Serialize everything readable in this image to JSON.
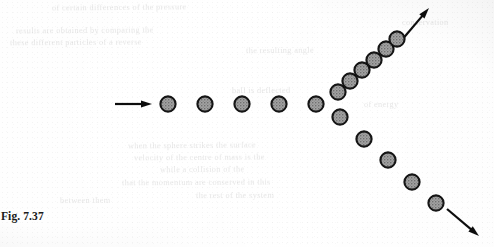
{
  "figure": {
    "caption": "Fig. 7.37",
    "background_color": "#f3f3f3",
    "ink_color": "#111111",
    "sphere_fill_color": "#9c9c9c",
    "sphere_outline_color": "#121212",
    "sphere_diameter": 17,
    "incoming_arrow": {
      "label": "incoming-direction-arrow",
      "x1": 115,
      "y1": 104,
      "x2": 152,
      "y2": 104
    },
    "upper_arrow": {
      "label": "upper-outgoing-direction-arrow",
      "x1": 401,
      "y1": 41,
      "x2": 429,
      "y2": 8
    },
    "lower_arrow": {
      "label": "lower-outgoing-direction-arrow",
      "x1": 447,
      "y1": 209,
      "x2": 479,
      "y2": 236
    },
    "chains": [
      {
        "name": "incoming-chain",
        "spheres": [
          {
            "cx": 168,
            "cy": 104
          },
          {
            "cx": 205,
            "cy": 104
          },
          {
            "cx": 242,
            "cy": 104
          },
          {
            "cx": 279,
            "cy": 104
          },
          {
            "cx": 316,
            "cy": 104
          }
        ]
      },
      {
        "name": "upper-outgoing-chain",
        "spheres": [
          {
            "cx": 338,
            "cy": 92
          },
          {
            "cx": 350,
            "cy": 81
          },
          {
            "cx": 362,
            "cy": 70
          },
          {
            "cx": 374,
            "cy": 60
          },
          {
            "cx": 386,
            "cy": 49
          },
          {
            "cx": 397,
            "cy": 39
          }
        ]
      },
      {
        "name": "lower-outgoing-chain",
        "spheres": [
          {
            "cx": 340,
            "cy": 117
          },
          {
            "cx": 364,
            "cy": 139
          },
          {
            "cx": 388,
            "cy": 160
          },
          {
            "cx": 412,
            "cy": 182
          },
          {
            "cx": 436,
            "cy": 203
          }
        ]
      }
    ]
  },
  "bleed_text": {
    "lines": [
      {
        "x": 52,
        "y": 3,
        "rot": -0.5,
        "text": "of certain differences of the pressure"
      },
      {
        "x": 16,
        "y": 26,
        "rot": -0.4,
        "text": "results are obtained by comparing the"
      },
      {
        "x": 10,
        "y": 38,
        "rot": -0.3,
        "text": "these different particles of a reverse"
      },
      {
        "x": 128,
        "y": 141,
        "rot": -0.5,
        "text": "when the sphere strikes the surface"
      },
      {
        "x": 134,
        "y": 153,
        "rot": -0.4,
        "text": "velocity of the centre of mass is the"
      },
      {
        "x": 160,
        "y": 165,
        "rot": -0.4,
        "text": "while a collision of the"
      },
      {
        "x": 122,
        "y": 178,
        "rot": -0.3,
        "text": "that the momentum are conserved in this"
      },
      {
        "x": 196,
        "y": 191,
        "rot": -0.3,
        "text": "the rest of the system"
      },
      {
        "x": 232,
        "y": 86,
        "rot": -0.4,
        "text": "ball is deflected"
      },
      {
        "x": 246,
        "y": 46,
        "rot": -0.5,
        "text": "the resulting angle"
      },
      {
        "x": 402,
        "y": 18,
        "rot": -0.4,
        "text": "conservation"
      },
      {
        "x": 364,
        "y": 100,
        "rot": -0.4,
        "text": "of energy"
      },
      {
        "x": 60,
        "y": 196,
        "rot": -0.3,
        "text": "between them"
      },
      {
        "x": 28,
        "y": 212,
        "rot": -0.4,
        "text": ""
      }
    ]
  }
}
